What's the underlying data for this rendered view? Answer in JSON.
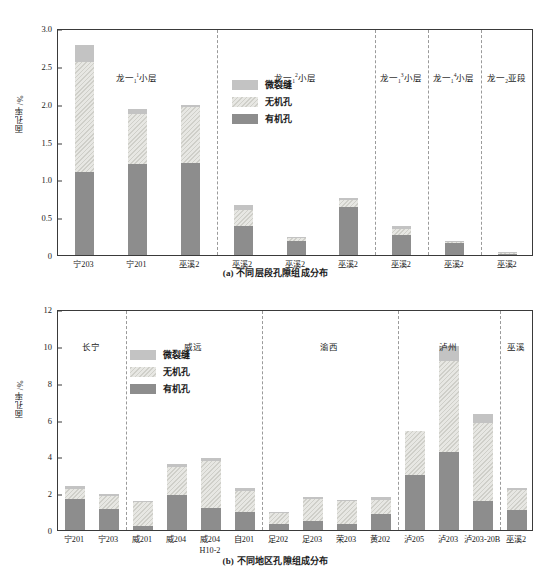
{
  "figure_a": {
    "caption": "(a) 不同层段孔隙组成分布",
    "ylabel": "面孔率/%",
    "yticks": [
      "0",
      "0.5",
      "1.0",
      "1.5",
      "2.0",
      "2.5",
      "3.0"
    ],
    "legend": [
      {
        "key": "frac",
        "label": "微裂缝"
      },
      {
        "key": "inorg",
        "label": "无机孔"
      },
      {
        "key": "org",
        "label": "有机孔"
      }
    ],
    "groups": [
      {
        "prefix": "龙一",
        "sub": "1",
        "sup": "1",
        "suffix": "小层",
        "span": 3
      },
      {
        "prefix": "龙一",
        "sub": "1",
        "sup": "2",
        "suffix": "小层",
        "span": 3
      },
      {
        "prefix": "龙一",
        "sub": "1",
        "sup": "3",
        "suffix": "小层",
        "span": 1
      },
      {
        "prefix": "龙一",
        "sub": "1",
        "sup": "4",
        "suffix": "小层",
        "span": 1
      },
      {
        "prefix": "龙一",
        "sub": "2",
        "sup": "",
        "suffix": "亚段",
        "span": 1
      }
    ]
  },
  "figure_b": {
    "caption": "(b) 不同地区孔隙组成分布",
    "ylabel": "面孔率/%",
    "yticks": [
      "0",
      "2",
      "4",
      "6",
      "8",
      "10",
      "12"
    ],
    "legend": [
      {
        "key": "frac",
        "label": "微裂缝"
      },
      {
        "key": "inorg",
        "label": "无机孔"
      },
      {
        "key": "org",
        "label": "有机孔"
      }
    ],
    "groups": [
      {
        "label": "长宁",
        "span": 2
      },
      {
        "label": "威远",
        "span": 4
      },
      {
        "label": "渝西",
        "span": 4
      },
      {
        "label": "泸州",
        "span": 3
      },
      {
        "label": "巫溪",
        "span": 1
      }
    ]
  },
  "chart_data": [
    {
      "id": "a",
      "type": "bar",
      "stacked": true,
      "title": "(a) 不同层段孔隙组成分布",
      "xlabel": "",
      "ylabel": "面孔率/%",
      "ylim": [
        0,
        3.0
      ],
      "ytick_values": [
        0,
        0.5,
        1.0,
        1.5,
        2.0,
        2.5,
        3.0
      ],
      "grid": false,
      "legend_position": "inside-top-center",
      "categories": [
        "宁203",
        "宁201",
        "巫溪2",
        "巫溪2",
        "巫溪2",
        "巫溪2",
        "巫溪2",
        "巫溪2",
        "巫溪2"
      ],
      "series": [
        {
          "name": "有机孔",
          "values": [
            1.1,
            1.2,
            1.22,
            0.38,
            0.18,
            0.64,
            0.27,
            0.16,
            0.02
          ]
        },
        {
          "name": "无机孔",
          "values": [
            1.45,
            0.67,
            0.73,
            0.22,
            0.04,
            0.09,
            0.08,
            0.02,
            0.01
          ]
        },
        {
          "name": "微裂缝",
          "values": [
            0.22,
            0.06,
            0.03,
            0.06,
            0.02,
            0.03,
            0.03,
            0.01,
            0.01
          ]
        }
      ],
      "totals": [
        2.77,
        1.93,
        1.98,
        0.66,
        0.24,
        0.76,
        0.38,
        0.19,
        0.04
      ]
    },
    {
      "id": "b",
      "type": "bar",
      "stacked": true,
      "title": "(b) 不同地区孔隙组成分布",
      "xlabel": "",
      "ylabel": "面孔率/%",
      "ylim": [
        0,
        12
      ],
      "ytick_values": [
        0,
        2,
        4,
        6,
        8,
        10,
        12
      ],
      "grid": false,
      "legend_position": "inside-upper-left",
      "categories": [
        "宁201",
        "宁203",
        "威201",
        "威204",
        "威204 H10-2",
        "自201",
        "足202",
        "足203",
        "荣203",
        "黄202",
        "泸205",
        "泸203",
        "泸203-20B",
        "巫溪2"
      ],
      "category_lines": [
        [
          "宁201",
          ""
        ],
        [
          "宁203",
          ""
        ],
        [
          "威201",
          ""
        ],
        [
          "威204",
          ""
        ],
        [
          "威204",
          "H10-2"
        ],
        [
          "自201",
          ""
        ],
        [
          "足202",
          ""
        ],
        [
          "足203",
          ""
        ],
        [
          "荣203",
          ""
        ],
        [
          "黄202",
          ""
        ],
        [
          "泸205",
          ""
        ],
        [
          "泸203",
          ""
        ],
        [
          "泸203-20B",
          ""
        ],
        [
          "巫溪2",
          ""
        ]
      ],
      "series": [
        {
          "name": "有机孔",
          "values": [
            1.7,
            1.15,
            0.22,
            1.88,
            1.2,
            1.0,
            0.33,
            0.5,
            0.3,
            0.85,
            3.0,
            4.25,
            1.55,
            1.1
          ]
        },
        {
          "name": "无机孔",
          "values": [
            0.55,
            0.7,
            1.28,
            1.52,
            2.55,
            1.1,
            0.6,
            1.2,
            1.25,
            0.8,
            2.35,
            4.95,
            4.25,
            1.05
          ]
        },
        {
          "name": "微裂缝",
          "values": [
            0.15,
            0.12,
            0.05,
            0.17,
            0.15,
            0.2,
            0.07,
            0.1,
            0.1,
            0.15,
            0.0,
            0.8,
            0.5,
            0.15
          ]
        }
      ],
      "totals": [
        2.4,
        1.97,
        1.55,
        3.57,
        3.9,
        2.3,
        1.0,
        1.8,
        1.65,
        1.8,
        5.35,
        10.0,
        6.3,
        2.3
      ]
    }
  ],
  "colors": {
    "organic": "#8d8d8d",
    "inorganic": "#e7e7e3",
    "microfracture": "#c3c3c3",
    "axis": "#3a3a3a",
    "divider": "#9a9a9a"
  }
}
